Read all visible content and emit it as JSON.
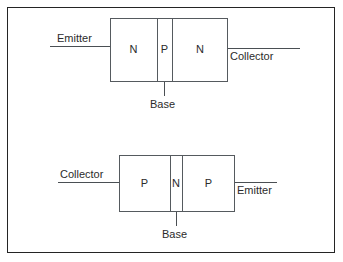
{
  "figure": {
    "background_color": "#ffffff",
    "line_color": "#555a5e",
    "text_color": "#2b2b2b",
    "border_color": "#242424"
  },
  "diagrams": [
    {
      "name": "npn-transistor",
      "regions": [
        {
          "label": "N"
        },
        {
          "label": "P"
        },
        {
          "label": "N"
        }
      ],
      "terminals": {
        "left": "Emitter",
        "right": "Collector",
        "bottom": "Base"
      }
    },
    {
      "name": "pnp-transistor",
      "regions": [
        {
          "label": "P"
        },
        {
          "label": "N"
        },
        {
          "label": "P"
        }
      ],
      "terminals": {
        "left": "Collector",
        "right": "Emitter",
        "bottom": "Base"
      }
    }
  ]
}
